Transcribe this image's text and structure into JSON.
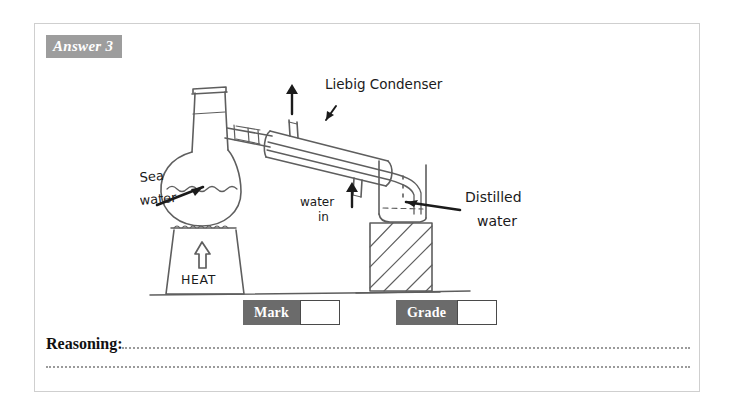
{
  "card": {
    "answer_tag": "Answer 3"
  },
  "diagram": {
    "annotations": [
      {
        "id": "sea-water",
        "line1": "Sea",
        "line2": "water"
      },
      {
        "id": "liebig-condenser",
        "text": "Liebig Condenser"
      },
      {
        "id": "water-in",
        "line1": "water",
        "line2": "in"
      },
      {
        "id": "distilled-water",
        "line1": "Distilled",
        "line2": "water"
      },
      {
        "id": "heat",
        "text": "HEAT"
      }
    ],
    "ink_color": "#5a5a5a",
    "pointer_color": "#1b1b1b"
  },
  "scores": {
    "mark_label": "Mark",
    "mark_value": "",
    "grade_label": "Grade",
    "grade_value": ""
  },
  "reasoning": {
    "label": "Reasoning:",
    "value": ""
  }
}
